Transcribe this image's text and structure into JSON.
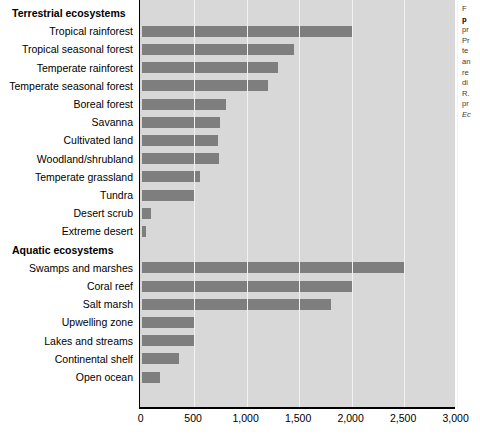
{
  "chart_data": {
    "type": "bar",
    "orientation": "horizontal",
    "title": "",
    "xlabel": "",
    "ylabel": "",
    "xlim": [
      0,
      3000
    ],
    "xticks": [
      0,
      500,
      1000,
      1500,
      2000,
      2500,
      3000
    ],
    "xtick_labels": [
      "0",
      "500",
      "1,000",
      "1,500",
      "2,000",
      "2,500",
      "3,000"
    ],
    "grid": true,
    "legend": "none",
    "bar_color": "#7e7e7e",
    "panel_color": "#d8d8d8",
    "groups": [
      {
        "name": "Terrestrial ecosystems",
        "categories": [
          "Tropical rainforest",
          "Tropical seasonal forest",
          "Temperate rainforest",
          "Temperate seasonal forest",
          "Boreal forest",
          "Savanna",
          "Cultivated land",
          "Woodland/shrubland",
          "Temperate grassland",
          "Tundra",
          "Desert scrub",
          "Extreme desert"
        ],
        "values": [
          2000,
          1450,
          1300,
          1200,
          800,
          750,
          730,
          740,
          560,
          500,
          90,
          40
        ]
      },
      {
        "name": "Aquatic ecosystems",
        "categories": [
          "Swamps and marshes",
          "Coral reef",
          "Salt marsh",
          "Upwelling zone",
          "Lakes and streams",
          "Continental shelf",
          "Open ocean"
        ],
        "values": [
          2500,
          2000,
          1800,
          500,
          500,
          360,
          180
        ]
      }
    ]
  },
  "caption": {
    "lines": [
      {
        "text": "F",
        "style": "normal"
      },
      {
        "text": "p",
        "style": "bold"
      },
      {
        "text": "pr",
        "style": "normal"
      },
      {
        "text": "Pr",
        "style": "normal"
      },
      {
        "text": "te",
        "style": "normal"
      },
      {
        "text": "an",
        "style": "normal"
      },
      {
        "text": "re",
        "style": "normal"
      },
      {
        "text": "di",
        "style": "normal"
      },
      {
        "text": "R.",
        "style": "normal"
      },
      {
        "text": "pr",
        "style": "normal"
      },
      {
        "text": "Ec",
        "style": "italic"
      }
    ]
  }
}
